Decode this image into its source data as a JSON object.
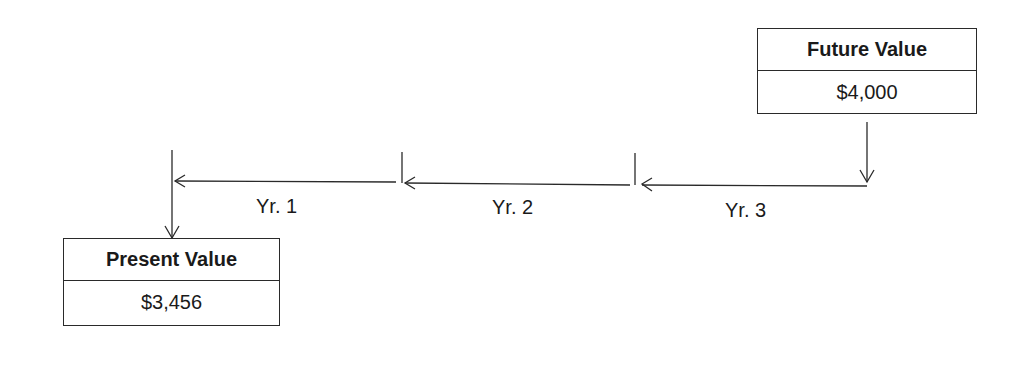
{
  "future_value": {
    "title": "Future Value",
    "amount": "$4,000"
  },
  "present_value": {
    "title": "Present Value",
    "amount": "$3,456"
  },
  "periods": [
    {
      "label": "Yr. 1"
    },
    {
      "label": "Yr. 2"
    },
    {
      "label": "Yr. 3"
    }
  ],
  "colors": {
    "line": "#2a2a2a",
    "background": "#ffffff"
  }
}
